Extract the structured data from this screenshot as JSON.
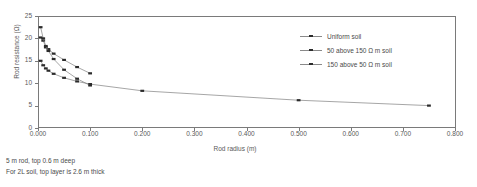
{
  "chart_data": {
    "type": "line",
    "title": "",
    "xlabel": "Rod radius (m)",
    "ylabel": "Rod resistance (Ω)",
    "xlim": [
      0.0,
      0.8
    ],
    "ylim": [
      0,
      25
    ],
    "xticks": [
      "0.000",
      "0.100",
      "0.200",
      "0.300",
      "0.400",
      "0.500",
      "0.600",
      "0.700",
      "0.800"
    ],
    "xtick_values": [
      0.0,
      0.1,
      0.2,
      0.3,
      0.4,
      0.5,
      0.6,
      0.7,
      0.8
    ],
    "yticks": [
      "0",
      "5",
      "10",
      "15",
      "20",
      "25"
    ],
    "ytick_values": [
      0,
      5,
      10,
      15,
      20,
      25
    ],
    "grid": false,
    "legend_position": "upper right",
    "marker": "square",
    "series": [
      {
        "name": "Uniform soil",
        "x": [
          0.005,
          0.01,
          0.015,
          0.02,
          0.03,
          0.05,
          0.075,
          0.1,
          0.2,
          0.5,
          0.75
        ],
        "y": [
          15.0,
          14.0,
          13.3,
          12.8,
          12.1,
          11.2,
          10.4,
          9.8,
          8.3,
          6.2,
          5.0
        ]
      },
      {
        "name": "50 above 150 Ω m soil",
        "x": [
          0.005,
          0.01,
          0.015,
          0.02,
          0.03,
          0.05,
          0.075,
          0.1
        ],
        "y": [
          20.2,
          19.5,
          18.0,
          17.6,
          16.6,
          15.2,
          13.6,
          12.2
        ]
      },
      {
        "name": "150 above 50 Ω m soil",
        "x": [
          0.005,
          0.01,
          0.015,
          0.02,
          0.03,
          0.05,
          0.075,
          0.1
        ],
        "y": [
          22.5,
          20.0,
          18.3,
          17.2,
          15.4,
          13.0,
          11.0,
          9.5
        ]
      }
    ]
  },
  "legend": {
    "items": [
      {
        "label": "Uniform soil"
      },
      {
        "label": "50 above 150 Ω m soil"
      },
      {
        "label": "150 above 50 Ω m soil"
      }
    ]
  },
  "footnotes": [
    "5 m rod, top 0.6 m deep",
    "For 2L soil, top layer is 2.6 m thick"
  ]
}
